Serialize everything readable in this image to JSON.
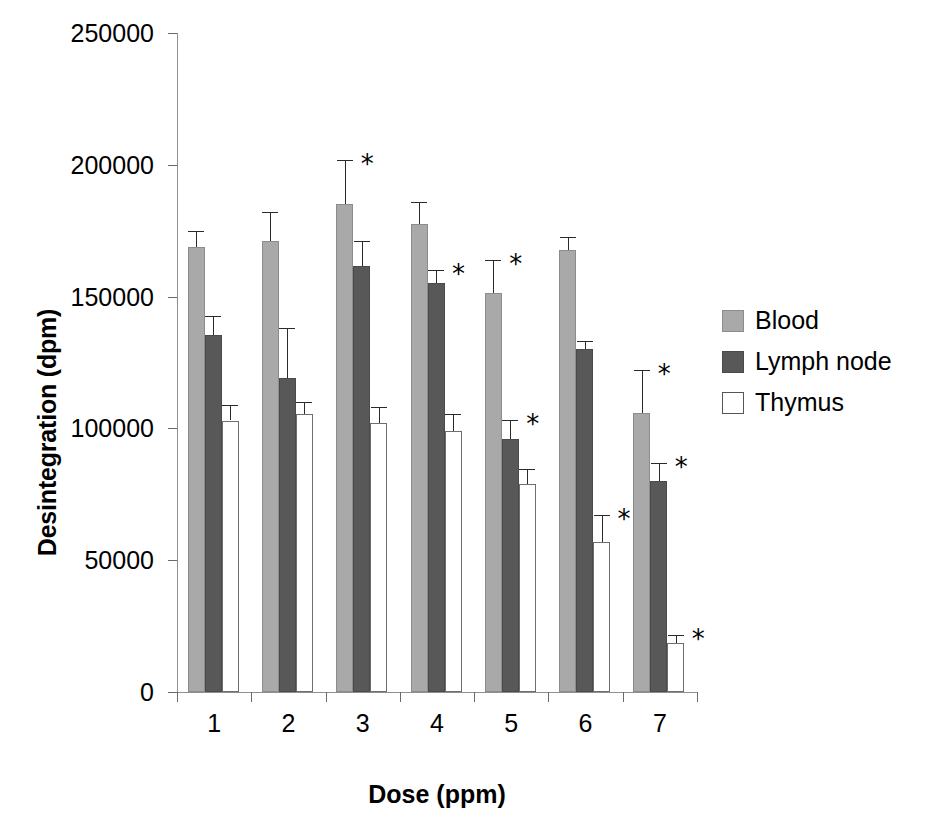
{
  "chart_data": {
    "type": "bar",
    "title": "",
    "xlabel": "Dose (ppm)",
    "ylabel": "Desintegration (dpm)",
    "categories": [
      "1",
      "2",
      "3",
      "4",
      "5",
      "6",
      "7"
    ],
    "ylim": [
      0,
      250000
    ],
    "yticks": [
      0,
      50000,
      100000,
      150000,
      200000,
      250000
    ],
    "ytick_labels": [
      "0",
      "50000",
      "100000",
      "150000",
      "200000",
      "250000"
    ],
    "grid": false,
    "legend_position": "right",
    "error_bar_type": "sem",
    "significance_marker": "*",
    "series": [
      {
        "name": "Blood",
        "color": "#a9a9a9",
        "values": [
          169000,
          171000,
          185000,
          177500,
          151500,
          167500,
          106000
        ],
        "errors": [
          6000,
          11000,
          17000,
          8500,
          12500,
          5000,
          16000
        ],
        "significant": [
          false,
          false,
          true,
          false,
          true,
          false,
          true
        ]
      },
      {
        "name": "Lymph node",
        "color": "#585858",
        "values": [
          135500,
          119000,
          161500,
          155000,
          96000,
          130000,
          80000
        ],
        "errors": [
          7000,
          19000,
          9500,
          5000,
          7000,
          3000,
          7000
        ],
        "significant": [
          false,
          false,
          false,
          true,
          true,
          false,
          true
        ]
      },
      {
        "name": "Thymus",
        "color": "#ffffff",
        "values": [
          103000,
          105500,
          102000,
          99000,
          79000,
          57000,
          18500
        ],
        "errors": [
          6000,
          4500,
          6000,
          6500,
          5500,
          10000,
          3000
        ],
        "significant": [
          false,
          false,
          false,
          false,
          false,
          true,
          true
        ]
      }
    ]
  },
  "legend": {
    "items": [
      {
        "label": "Blood",
        "key": "blood"
      },
      {
        "label": "Lymph node",
        "key": "lymph"
      },
      {
        "label": "Thymus",
        "key": "thymus"
      }
    ]
  },
  "axes": {
    "x_title": "Dose (ppm)",
    "y_title": "Desintegration (dpm)"
  }
}
